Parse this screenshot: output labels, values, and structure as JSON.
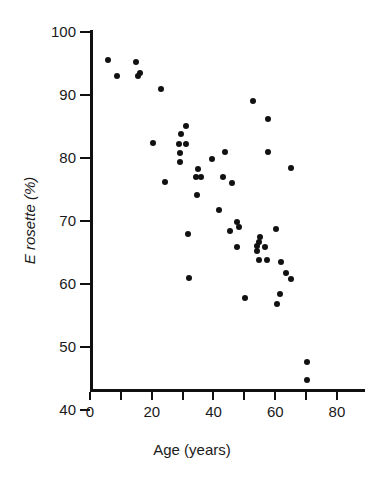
{
  "chart_data": {
    "type": "scatter",
    "title": "",
    "xlabel": "Age (years)",
    "ylabel": "E rosette (%)",
    "xlim": [
      0,
      88
    ],
    "ylim": [
      40,
      102
    ],
    "xticks": [
      0,
      10,
      20,
      30,
      40,
      50,
      60,
      70,
      80
    ],
    "xtick_labels": [
      "0",
      "",
      "20",
      "",
      "40",
      "",
      "60",
      "",
      "80"
    ],
    "yticks": [
      40,
      50,
      60,
      70,
      80,
      90,
      100
    ],
    "ytick_labels": [
      "40",
      "50",
      "60",
      "70",
      "80",
      "90",
      "100"
    ],
    "grid": false,
    "legend": null,
    "marker": "filled-circle",
    "marker_color": "#111111",
    "points": [
      {
        "x": 5.8,
        "y": 95.5
      },
      {
        "x": 8.7,
        "y": 93.0
      },
      {
        "x": 14.9,
        "y": 95.3
      },
      {
        "x": 16.2,
        "y": 93.5
      },
      {
        "x": 15.5,
        "y": 93.0
      },
      {
        "x": 23.0,
        "y": 91.0
      },
      {
        "x": 20.4,
        "y": 82.4
      },
      {
        "x": 24.3,
        "y": 76.2
      },
      {
        "x": 28.8,
        "y": 82.2
      },
      {
        "x": 29.5,
        "y": 83.8
      },
      {
        "x": 31.1,
        "y": 85.1
      },
      {
        "x": 31.2,
        "y": 82.2
      },
      {
        "x": 29.2,
        "y": 80.8
      },
      {
        "x": 29.1,
        "y": 79.4
      },
      {
        "x": 35.0,
        "y": 78.3
      },
      {
        "x": 34.3,
        "y": 77.0
      },
      {
        "x": 36.0,
        "y": 77.0
      },
      {
        "x": 31.9,
        "y": 68.0
      },
      {
        "x": 32.0,
        "y": 61.0
      },
      {
        "x": 34.5,
        "y": 74.2
      },
      {
        "x": 39.5,
        "y": 79.8
      },
      {
        "x": 43.8,
        "y": 81.0
      },
      {
        "x": 43.0,
        "y": 77.0
      },
      {
        "x": 46.0,
        "y": 76.0
      },
      {
        "x": 41.8,
        "y": 71.8
      },
      {
        "x": 45.3,
        "y": 68.4
      },
      {
        "x": 47.6,
        "y": 69.8
      },
      {
        "x": 48.2,
        "y": 69.0
      },
      {
        "x": 47.6,
        "y": 65.8
      },
      {
        "x": 50.2,
        "y": 57.8
      },
      {
        "x": 52.8,
        "y": 89.0
      },
      {
        "x": 57.7,
        "y": 86.2
      },
      {
        "x": 57.6,
        "y": 81.0
      },
      {
        "x": 55.0,
        "y": 67.5
      },
      {
        "x": 54.8,
        "y": 66.7
      },
      {
        "x": 54.0,
        "y": 66.0
      },
      {
        "x": 54.2,
        "y": 65.2
      },
      {
        "x": 56.6,
        "y": 65.8
      },
      {
        "x": 54.6,
        "y": 63.8
      },
      {
        "x": 57.3,
        "y": 63.8
      },
      {
        "x": 60.3,
        "y": 68.8
      },
      {
        "x": 61.9,
        "y": 63.5
      },
      {
        "x": 63.5,
        "y": 61.8
      },
      {
        "x": 61.5,
        "y": 58.4
      },
      {
        "x": 60.6,
        "y": 56.8
      },
      {
        "x": 65.1,
        "y": 60.8
      },
      {
        "x": 65.0,
        "y": 78.4
      },
      {
        "x": 70.3,
        "y": 47.6
      },
      {
        "x": 70.3,
        "y": 44.8
      }
    ]
  }
}
